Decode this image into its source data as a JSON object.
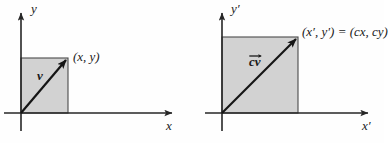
{
  "figure": {
    "background_color": "#fefefe",
    "line_color": "#262626",
    "fill_color": "#d2d2d2",
    "fill_border_color": "#4a4a4a"
  },
  "panels": [
    {
      "id": "original-vector",
      "axes": {
        "y_label": "y",
        "x_label": "x"
      },
      "vector_label": "v",
      "vector_has_overline": false,
      "point_label": "(x, y)",
      "origin": {
        "x": 21,
        "y": 113
      },
      "tip": {
        "x": 68,
        "y": 58
      }
    },
    {
      "id": "scaled-vector",
      "axes": {
        "y_label": "y′",
        "x_label": "x′"
      },
      "vector_label": "cv",
      "vector_has_overline": true,
      "point_label": "(x′, y′) = (cx, cy)",
      "origin": {
        "x": 222,
        "y": 113
      },
      "tip": {
        "x": 298,
        "y": 37
      }
    }
  ]
}
